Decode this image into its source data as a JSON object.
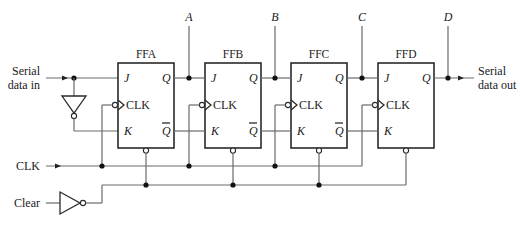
{
  "diagram": {
    "inputs": {
      "serial_in_line1": "Serial",
      "serial_in_line2": "data in",
      "clk": "CLK",
      "clear": "Clear"
    },
    "outputs": {
      "serial_out_line1": "Serial",
      "serial_out_line2": "data out"
    },
    "taps": [
      "A",
      "B",
      "C",
      "D"
    ],
    "flipflops": [
      {
        "name": "FFA",
        "j": "J",
        "k": "K",
        "clk": "CLK",
        "q": "Q",
        "qbar": "Q"
      },
      {
        "name": "FFB",
        "j": "J",
        "k": "K",
        "clk": "CLK",
        "q": "Q",
        "qbar": "Q"
      },
      {
        "name": "FFC",
        "j": "J",
        "k": "K",
        "clk": "CLK",
        "q": "Q",
        "qbar": "Q"
      },
      {
        "name": "FFD",
        "j": "J",
        "k": "K",
        "clk": "CLK",
        "q": "Q"
      }
    ],
    "colors": {
      "wire": "#6a6a6a",
      "outline": "#2a2a2a",
      "junction": "#111111"
    }
  }
}
